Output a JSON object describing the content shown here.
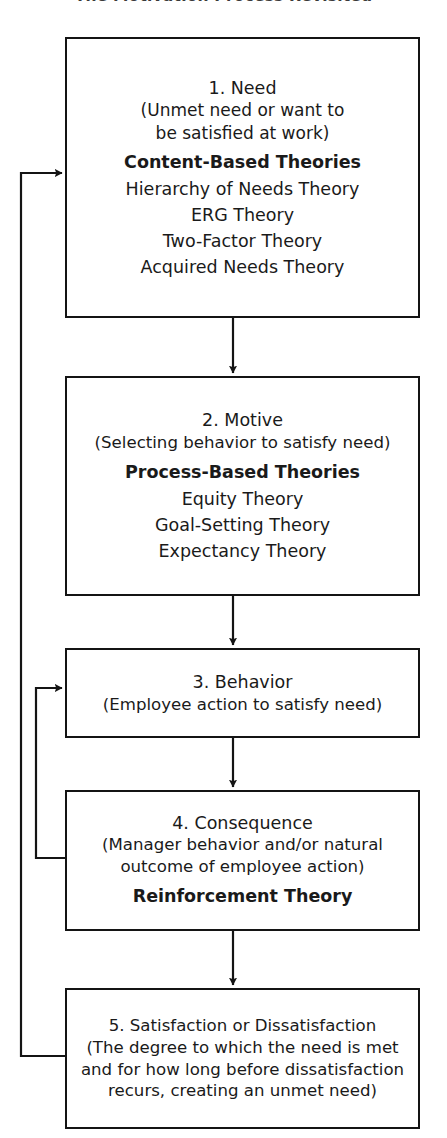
{
  "figure": {
    "title": "The Motivation Process Revisited",
    "title_clipped": true,
    "background_color": "#ffffff",
    "line_color": "#141414"
  },
  "nodes": [
    {
      "id": "node-1",
      "heading": "1. Need",
      "description": [
        "(Unmet need or want to",
        "be satisfied at work)"
      ],
      "group_label": "Content-Based Theories",
      "items": [
        "Hierarchy of Needs Theory",
        "ERG Theory",
        "Two-Factor Theory",
        "Acquired Needs Theory"
      ]
    },
    {
      "id": "node-2",
      "heading": "2.  Motive",
      "description": [
        "(Selecting behavior to satisfy need)"
      ],
      "group_label": "Process-Based Theories",
      "items": [
        "Equity Theory",
        "Goal-Setting Theory",
        "Expectancy Theory"
      ]
    },
    {
      "id": "node-3",
      "heading": "3. Behavior",
      "description": [
        "(Employee action to satisfy need)"
      ],
      "group_label": "",
      "items": []
    },
    {
      "id": "node-4",
      "heading": "4. Consequence",
      "description": [
        "(Manager behavior and/or natural",
        "outcome of employee action)"
      ],
      "group_label": "Reinforcement Theory",
      "items": []
    },
    {
      "id": "node-5",
      "heading": "5. Satisfaction or Dissatisfaction",
      "description": [
        "(The degree to which the need is met",
        "and for how long before dissatisfaction",
        "recurs, creating an unmet need)"
      ],
      "group_label": "",
      "items": []
    }
  ],
  "connectors": [
    {
      "name": "arrow-need-to-motive",
      "from": "node-1",
      "to": "node-2",
      "direction": "down"
    },
    {
      "name": "arrow-motive-to-behavior",
      "from": "node-2",
      "to": "node-3",
      "direction": "down"
    },
    {
      "name": "arrow-behavior-to-consequence",
      "from": "node-3",
      "to": "node-4",
      "direction": "down"
    },
    {
      "name": "arrow-consequence-to-satisfaction",
      "from": "node-4",
      "to": "node-5",
      "direction": "down"
    },
    {
      "name": "feedback-consequence-to-behavior",
      "from": "node-4",
      "to": "node-3",
      "direction": "left-up-right"
    },
    {
      "name": "feedback-satisfaction-to-need",
      "from": "node-5",
      "to": "node-1",
      "direction": "left-up-right"
    }
  ]
}
